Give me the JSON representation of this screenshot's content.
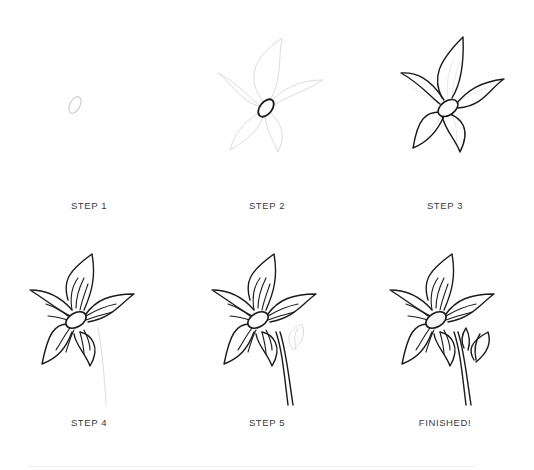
{
  "diagram": {
    "steps": [
      {
        "label": "STEP 1",
        "description": "Draw a small oval for the flower center"
      },
      {
        "label": "STEP 2",
        "description": "Darken the center; sketch five pointed petals in light guide lines"
      },
      {
        "label": "STEP 3",
        "description": "Ink the five pointed petals around the center"
      },
      {
        "label": "STEP 4",
        "description": "Add vein lines radiating from the center; sketch stem guide"
      },
      {
        "label": "STEP 5",
        "description": "Ink the stem; sketch a leaf guide"
      },
      {
        "label": "FINISHED!",
        "description": "Ink the leaf bud for the finished flower"
      }
    ]
  },
  "colors": {
    "ink": "#1a1a1a",
    "guide": "#dcdcdc",
    "label": "#3a3a3a",
    "background": "#ffffff"
  }
}
